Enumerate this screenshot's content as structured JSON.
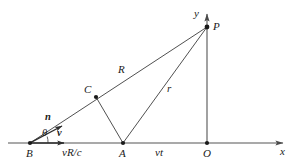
{
  "figure": {
    "background_color": "#ffffff",
    "line_color": "#3c3c3c",
    "axis_color": "#555555",
    "text_color": "#1a1a1a",
    "width": 294,
    "height": 168
  },
  "axes": {
    "x": {
      "label": "x",
      "label_pos": {
        "x": 280,
        "y": 146
      },
      "start": {
        "x": 8,
        "y": 143
      },
      "end": {
        "x": 286,
        "y": 143
      },
      "arrow": "right"
    },
    "y": {
      "label": "y",
      "label_pos": {
        "x": 194,
        "y": 8
      },
      "start": {
        "x": 207,
        "y": 143
      },
      "end": {
        "x": 207,
        "y": 10
      },
      "arrow": "up"
    }
  },
  "points": [
    {
      "id": "B",
      "label": "B",
      "x": 30,
      "y": 143,
      "label_pos": {
        "x": 26,
        "y": 148
      },
      "dot": true
    },
    {
      "id": "A",
      "label": "A",
      "x": 123,
      "y": 143,
      "label_pos": {
        "x": 119,
        "y": 148
      },
      "dot": true
    },
    {
      "id": "O",
      "label": "O",
      "x": 207,
      "y": 143,
      "label_pos": {
        "x": 203,
        "y": 148
      },
      "dot": true
    },
    {
      "id": "C",
      "label": "C",
      "x": 96,
      "y": 97,
      "label_pos": {
        "x": 84,
        "y": 84
      },
      "dot": true
    },
    {
      "id": "P",
      "label": "P",
      "x": 207,
      "y": 27,
      "label_pos": {
        "x": 213,
        "y": 21
      },
      "dot": true
    }
  ],
  "segments": [
    {
      "id": "BP",
      "from": "B",
      "to": "P",
      "label": "R",
      "label_pos": {
        "x": 118,
        "y": 64
      }
    },
    {
      "id": "CA",
      "from": "C",
      "to": "A",
      "label": "",
      "label_pos": null
    },
    {
      "id": "AP",
      "from": "A",
      "to": "P",
      "label": "r",
      "label_pos": {
        "x": 167,
        "y": 83
      }
    }
  ],
  "vectors": [
    {
      "id": "n",
      "label": "n",
      "bold": true,
      "from": {
        "x": 30,
        "y": 143
      },
      "to": {
        "x": 64,
        "y": 126
      },
      "label_pos": {
        "x": 45,
        "y": 112
      }
    },
    {
      "id": "v",
      "label": "v",
      "bold": true,
      "from": {
        "x": 30,
        "y": 143
      },
      "to": {
        "x": 68,
        "y": 143
      },
      "label_pos": {
        "x": 57,
        "y": 128
      }
    }
  ],
  "angle": {
    "label": "θ",
    "label_pos": {
      "x": 42,
      "y": 128
    },
    "vertex": "B",
    "arc_radius": 16
  },
  "distance_labels": [
    {
      "id": "vRc",
      "label": "vR/c",
      "pos": {
        "x": 62,
        "y": 147
      },
      "between": [
        "B",
        "A"
      ]
    },
    {
      "id": "vt",
      "label": "vt",
      "pos": {
        "x": 155,
        "y": 147
      },
      "between": [
        "A",
        "O"
      ]
    }
  ]
}
